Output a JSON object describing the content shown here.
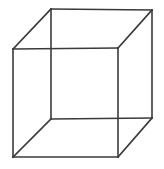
{
  "figure": {
    "title": "Necker Cube",
    "kind": "wireframe-cube-line-drawing",
    "canvas": {
      "width": 164,
      "height": 169,
      "background_color": "#ffffff"
    },
    "stroke": {
      "color": "#3a3a3a",
      "width": 1.6,
      "style": "solid"
    },
    "vertices": {
      "back_top_left": {
        "x": 51,
        "y": 9
      },
      "back_top_right": {
        "x": 152,
        "y": 10
      },
      "back_bottom_right": {
        "x": 152,
        "y": 118
      },
      "back_bottom_left": {
        "x": 51,
        "y": 119
      },
      "front_top_left": {
        "x": 13,
        "y": 49
      },
      "front_top_right": {
        "x": 118,
        "y": 48
      },
      "front_bottom_right": {
        "x": 118,
        "y": 157
      },
      "front_bottom_left": {
        "x": 13,
        "y": 157
      }
    },
    "edges": [
      {
        "name": "back-face-top",
        "from": "back_top_left",
        "to": "back_top_right",
        "path": "M 51 9 L 152 10"
      },
      {
        "name": "back-face-right",
        "from": "back_top_right",
        "to": "back_bottom_right",
        "path": "M 152 10 L 152 118"
      },
      {
        "name": "back-face-bottom",
        "from": "back_bottom_right",
        "to": "back_bottom_left",
        "path": "M 152 118 L 51 119"
      },
      {
        "name": "back-face-left",
        "from": "back_bottom_left",
        "to": "back_top_left",
        "path": "M 51 119 L 51 9"
      },
      {
        "name": "front-face-top",
        "from": "front_top_left",
        "to": "front_top_right",
        "path": "M 13 49 L 118 48"
      },
      {
        "name": "front-face-right",
        "from": "front_top_right",
        "to": "front_bottom_right",
        "path": "M 118 48 L 118 157"
      },
      {
        "name": "front-face-bottom",
        "from": "front_bottom_right",
        "to": "front_bottom_left",
        "path": "M 118 157 L 13 157"
      },
      {
        "name": "front-face-left",
        "from": "front_bottom_left",
        "to": "front_top_left",
        "path": "M 13 157 L 13 49"
      },
      {
        "name": "connector-top-left",
        "from": "front_top_left",
        "to": "back_top_left",
        "path": "M 13 49 L 51 9"
      },
      {
        "name": "connector-top-right",
        "from": "front_top_right",
        "to": "back_top_right",
        "path": "M 118 48 L 152 10"
      },
      {
        "name": "connector-bottom-right",
        "from": "front_bottom_right",
        "to": "back_bottom_right",
        "path": "M 118 157 L 152 118"
      },
      {
        "name": "connector-bottom-left",
        "from": "front_bottom_left",
        "to": "back_bottom_left",
        "path": "M 13 157 L 51 119"
      }
    ]
  }
}
